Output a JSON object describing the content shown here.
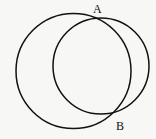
{
  "diagram": {
    "type": "two intersecting circles",
    "stroke_color": "#111111",
    "background": "#f7f7f5",
    "circles": [
      {
        "name": "large-circle",
        "cx": 73.5,
        "cy": 71,
        "r": 58
      },
      {
        "name": "small-circle",
        "cx": 101,
        "cy": 66,
        "r": 48
      }
    ],
    "points": [
      {
        "label": "A",
        "x": 97,
        "y": 14
      },
      {
        "label": "B",
        "x": 121,
        "y": 130
      }
    ]
  }
}
